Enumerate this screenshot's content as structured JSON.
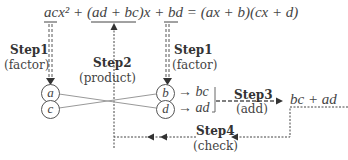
{
  "equation": {
    "lhs_ac": "ac",
    "lhs_x2": "x²",
    "plus1": " + (",
    "lhs_mid": "ad + bc",
    "close_x": ")x + ",
    "lhs_bd": "bd",
    "rhs": " = (ax + b)(cx + d)"
  },
  "steps": [
    {
      "label": "Step1",
      "sub": "(factor)"
    },
    {
      "label": "Step2",
      "sub": "(product)"
    },
    {
      "label": "Step1",
      "sub": "(factor)"
    },
    {
      "label": "Step3",
      "sub": "(add)"
    },
    {
      "label": "Step4",
      "sub": "(check)"
    }
  ],
  "circles": {
    "left": [
      "a",
      "c"
    ],
    "right": [
      "b",
      "d"
    ]
  },
  "products": [
    "→ bc",
    "→ ad"
  ],
  "sum_result": "bc + ad",
  "colors": {
    "line": "#444444",
    "cross": "#999999"
  }
}
